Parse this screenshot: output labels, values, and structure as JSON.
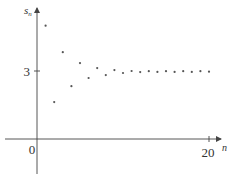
{
  "chart_data": {
    "type": "scatter",
    "title": "",
    "xlabel": "n",
    "ylabel": "s_n",
    "ylabel_base": "s",
    "ylabel_sub": "n",
    "x_tick_labels": [
      "0",
      "20"
    ],
    "y_tick_labels": [
      "3"
    ],
    "xlim": [
      0,
      20
    ],
    "ylim": [
      -1,
      5.5
    ],
    "grid": false,
    "legend": null,
    "series": [
      {
        "name": "s_n",
        "x": [
          1,
          2,
          3,
          4,
          5,
          6,
          7,
          8,
          9,
          10,
          11,
          12,
          13,
          14,
          15,
          16,
          17,
          18,
          19,
          20
        ],
        "y": [
          5.0,
          1.63,
          3.83,
          2.33,
          3.35,
          2.69,
          3.13,
          2.82,
          3.04,
          2.91,
          3.0,
          2.95,
          2.99,
          2.96,
          2.99,
          2.96,
          2.99,
          2.96,
          2.99,
          2.97
        ]
      }
    ]
  },
  "colors": {
    "axis": "#444444",
    "points": "#555555",
    "text": "#333333"
  }
}
